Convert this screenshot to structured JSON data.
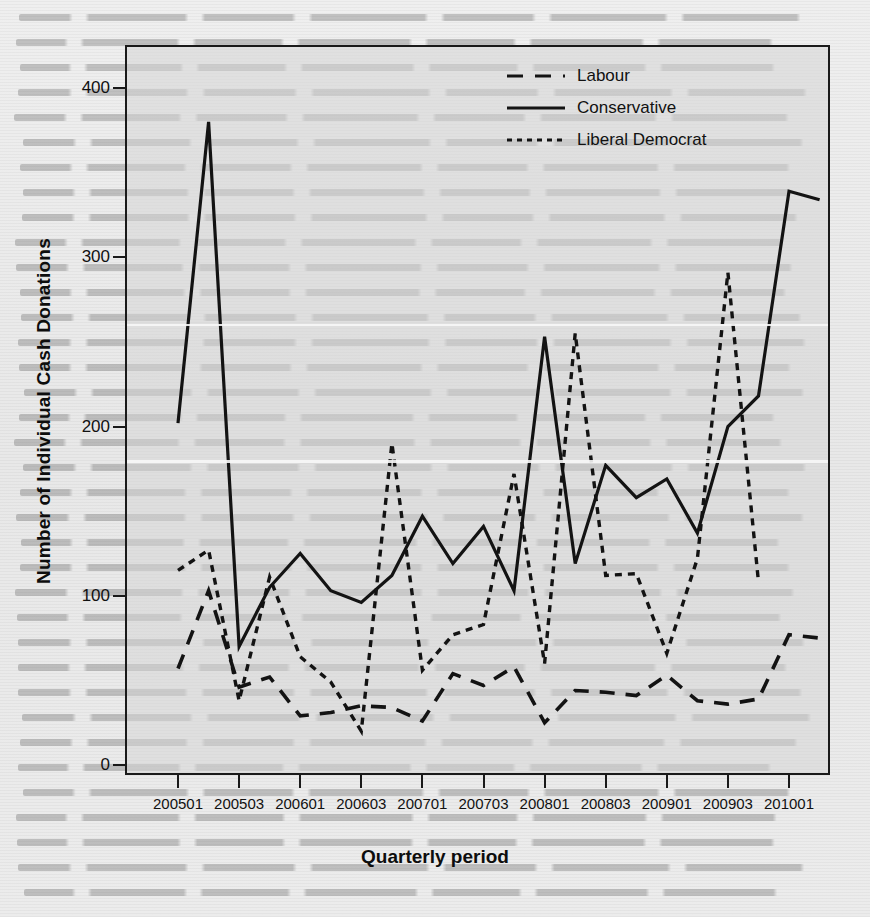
{
  "chart_data": {
    "type": "line",
    "title": "",
    "xlabel": "Quarterly period",
    "ylabel": "Number of Individual Cash Donations",
    "ylim": [
      0,
      420
    ],
    "yticks": [
      0,
      100,
      200,
      300,
      400
    ],
    "xticks": [
      "200501",
      "200503",
      "200601",
      "200603",
      "200701",
      "200703",
      "200801",
      "200803",
      "200901",
      "200903",
      "201001"
    ],
    "x": [
      "200501",
      "200502",
      "200503",
      "200504",
      "200601",
      "200602",
      "200603",
      "200604",
      "200701",
      "200702",
      "200703",
      "200704",
      "200801",
      "200802",
      "200803",
      "200804",
      "200901",
      "200902",
      "200903",
      "200904",
      "201001",
      "201002"
    ],
    "grid": false,
    "legend_position": "top-right",
    "series": [
      {
        "name": "Labour",
        "style": "dashed",
        "color": "#111111",
        "values": [
          57,
          103,
          46,
          52,
          29,
          31,
          35,
          34,
          26,
          54,
          47,
          58,
          25,
          44,
          43,
          41,
          53,
          38,
          36,
          39,
          77,
          75
        ]
      },
      {
        "name": "Conservative",
        "style": "solid",
        "color": "#111111",
        "values": [
          202,
          380,
          70,
          105,
          125,
          103,
          96,
          112,
          147,
          119,
          141,
          103,
          253,
          119,
          177,
          158,
          169,
          137,
          200,
          218,
          339,
          334
        ]
      },
      {
        "name": "Liberal Democrat",
        "style": "dotted",
        "color": "#111111",
        "values": [
          115,
          127,
          38,
          111,
          64,
          49,
          20,
          190,
          56,
          77,
          83,
          172,
          60,
          255,
          112,
          113,
          66,
          122,
          291,
          108,
          null,
          null
        ]
      }
    ]
  },
  "legend": {
    "items": [
      {
        "label": "Labour",
        "key": "dashed-line-key"
      },
      {
        "label": "Conservative",
        "key": "solid-line-key"
      },
      {
        "label": "Liberal Democrat",
        "key": "dotted-line-key"
      }
    ]
  },
  "axes": {
    "y_label": "Number of Individual Cash Donations",
    "x_label": "Quarterly period",
    "y_tick_labels": [
      "0",
      "100",
      "200",
      "300",
      "400"
    ],
    "x_tick_labels": [
      "200501",
      "200503",
      "200601",
      "200603",
      "200701",
      "200703",
      "200801",
      "200803",
      "200901",
      "200903",
      "201001"
    ]
  }
}
